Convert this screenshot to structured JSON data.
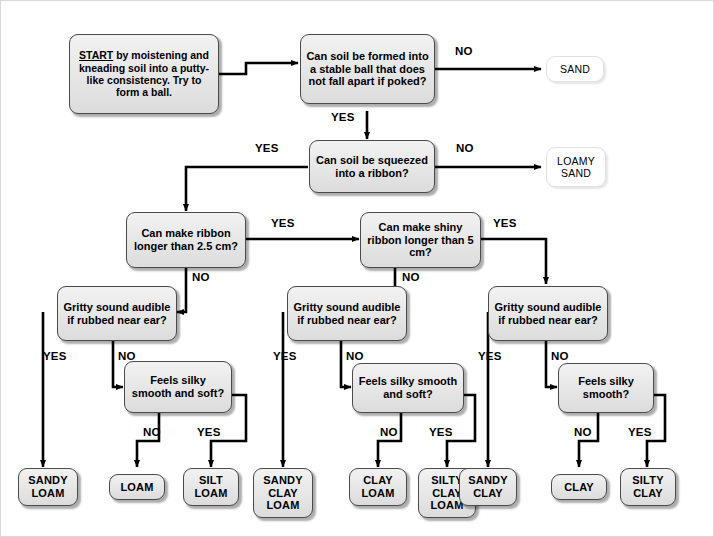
{
  "diagram": {
    "colors": {
      "node_fill": "#e6e6e6",
      "node_border": "#4a4a4a",
      "line": "#000000",
      "page_background": "#ffffff"
    }
  },
  "nodes": {
    "start": {
      "id": "start",
      "kind": "start",
      "label_lead": "START",
      "label_rest": " by moistening and kneading soil into a putty-like consistency. Try to form a ball."
    },
    "d_ball": {
      "id": "d_ball",
      "kind": "decision",
      "label": "Can soil be formed into  a stable ball that does not fall apart if poked?"
    },
    "d_ribbon": {
      "id": "d_ribbon",
      "kind": "decision",
      "label": "Can soil be squeezed into a ribbon?"
    },
    "d_ribbon25": {
      "id": "d_ribbon25",
      "kind": "decision",
      "label": "Can make ribbon longer than 2.5 cm?"
    },
    "d_ribbon5": {
      "id": "d_ribbon5",
      "kind": "decision",
      "label": "Can make shiny ribbon longer than 5 cm?"
    },
    "d_gritty_left": {
      "id": "d_gritty_left",
      "kind": "decision",
      "label": "Gritty sound audible if rubbed near ear?"
    },
    "d_gritty_mid": {
      "id": "d_gritty_mid",
      "kind": "decision",
      "label": "Gritty sound audible if rubbed near ear?"
    },
    "d_gritty_right": {
      "id": "d_gritty_right",
      "kind": "decision",
      "label": "Gritty sound audible if rubbed near ear?"
    },
    "d_silky_left": {
      "id": "d_silky_left",
      "kind": "decision",
      "label": "Feels silky smooth and soft?"
    },
    "d_silky_mid": {
      "id": "d_silky_mid",
      "kind": "decision",
      "label": "Feels silky smooth and soft?"
    },
    "d_silky_right": {
      "id": "d_silky_right",
      "kind": "decision",
      "label": "Feels silky smooth?"
    },
    "t_sand": {
      "id": "t_sand",
      "kind": "terminal-plain",
      "label": "SAND"
    },
    "t_loamy_sand": {
      "id": "t_loamy_sand",
      "kind": "terminal-plain",
      "label": "LOAMY SAND"
    },
    "t_sandy_loam": {
      "id": "t_sandy_loam",
      "kind": "terminal",
      "label": "SANDY LOAM"
    },
    "t_loam": {
      "id": "t_loam",
      "kind": "terminal",
      "label": "LOAM"
    },
    "t_silt_loam": {
      "id": "t_silt_loam",
      "kind": "terminal",
      "label": "SILT LOAM"
    },
    "t_sandy_clay_loam": {
      "id": "t_sandy_clay_loam",
      "kind": "terminal",
      "label": "SANDY CLAY LOAM"
    },
    "t_clay_loam": {
      "id": "t_clay_loam",
      "kind": "terminal",
      "label": "CLAY LOAM"
    },
    "t_silty_clay_loam": {
      "id": "t_silty_clay_loam",
      "kind": "terminal",
      "label": "SILTY CLAY LOAM"
    },
    "t_sandy_clay": {
      "id": "t_sandy_clay",
      "kind": "terminal",
      "label": "SANDY CLAY"
    },
    "t_clay": {
      "id": "t_clay",
      "kind": "terminal",
      "label": "CLAY"
    },
    "t_silty_clay": {
      "id": "t_silty_clay",
      "kind": "terminal",
      "label": "SILTY CLAY"
    }
  },
  "edge_labels": {
    "ball_no": "NO",
    "ball_yes": "YES",
    "ribbon_yes": "YES",
    "ribbon_no": "NO",
    "r25_yes": "YES",
    "r25_no": "NO",
    "r5_yes": "YES",
    "r5_no": "NO",
    "gritty_left_yes": "YES",
    "gritty_left_no": "NO",
    "gritty_mid_yes": "YES",
    "gritty_mid_no": "NO",
    "gritty_right_yes": "YES",
    "gritty_right_no": "NO",
    "silky_left_no": "NO",
    "silky_left_yes": "YES",
    "silky_mid_no": "NO",
    "silky_mid_yes": "YES",
    "silky_right_no": "NO",
    "silky_right_yes": "YES"
  }
}
